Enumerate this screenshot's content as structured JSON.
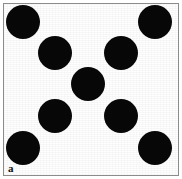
{
  "figure": {
    "width": 182,
    "height": 179,
    "background_color": "#ffffff",
    "panel_label": "a",
    "panel_label_position": {
      "x": 8,
      "y": 163
    },
    "panel_label_font_size": 11,
    "frame": {
      "x": 3,
      "y": 3,
      "width": 176,
      "height": 173,
      "border_width": 1,
      "border_color": "#8c8c8c",
      "fill_color": "#ffffff"
    },
    "disc_color": "#080808",
    "disc_radius": 17,
    "disc_count": 9,
    "arrangement": "3x3 quincunx grid of filled circles",
    "discs": [
      {
        "name": "disc-top-left",
        "cx": 23,
        "cy": 22,
        "r": 17
      },
      {
        "name": "disc-top-right",
        "cx": 155,
        "cy": 22,
        "r": 17
      },
      {
        "name": "disc-upper-left",
        "cx": 55,
        "cy": 53,
        "r": 17
      },
      {
        "name": "disc-upper-right",
        "cx": 121,
        "cy": 53,
        "r": 17
      },
      {
        "name": "disc-center",
        "cx": 88,
        "cy": 84,
        "r": 17
      },
      {
        "name": "disc-lower-left",
        "cx": 55,
        "cy": 116,
        "r": 17
      },
      {
        "name": "disc-lower-right",
        "cx": 121,
        "cy": 116,
        "r": 17
      },
      {
        "name": "disc-bottom-left",
        "cx": 23,
        "cy": 148,
        "r": 17
      },
      {
        "name": "disc-bottom-right",
        "cx": 155,
        "cy": 148,
        "r": 17
      }
    ]
  }
}
